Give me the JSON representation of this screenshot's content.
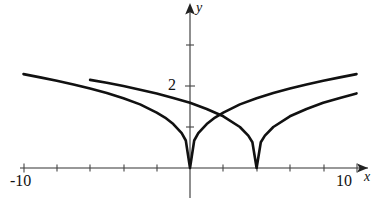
{
  "figure": {
    "background_color": "#ffffff",
    "curve_color": "#111111",
    "axis_color": "#333333"
  },
  "labels": {
    "y_axis_name": "y",
    "x_axis_name": "x",
    "x_min_tick": "-10",
    "x_max_tick": "10",
    "y_tick_two": "2"
  },
  "chart_data": {
    "type": "line",
    "title": "",
    "xlabel": "x",
    "ylabel": "y",
    "xlim": [
      -10,
      10
    ],
    "ylim": [
      0,
      3.2
    ],
    "grid": false,
    "legend": null,
    "x_ticks": [
      -10,
      -8,
      -6,
      -4,
      -2,
      0,
      2,
      4,
      6,
      8,
      10
    ],
    "x_tick_labels": [
      "-10",
      "",
      "",
      "",
      "",
      "",
      "",
      "",
      "",
      "",
      "10"
    ],
    "y_ticks": [
      1,
      2,
      3
    ],
    "y_tick_labels": [
      "",
      "2",
      ""
    ],
    "axis_arrows": [
      "x-positive",
      "y-positive"
    ],
    "annotations": [
      {
        "text": "cusp at origin",
        "x": 0,
        "y": 0
      },
      {
        "text": "cusp at x = 4",
        "x": 4,
        "y": 0
      },
      {
        "text": "curves intersect",
        "x": 2,
        "y": 0.8
      }
    ],
    "series": [
      {
        "name": "y = |x|^(1/3)",
        "cusp_x": 0,
        "cusp_y": 0,
        "x": [
          -10.0,
          -9.0,
          -8.0,
          -7.0,
          -6.0,
          -5.0,
          -4.0,
          -3.0,
          -2.0,
          -1.5,
          -1.0,
          -0.5,
          -0.25,
          0.0,
          0.25,
          0.5,
          1.0,
          1.5,
          2.0,
          3.0,
          4.0,
          5.0,
          6.0,
          7.0,
          8.0,
          9.0,
          10.0
        ],
        "y": [
          2.29,
          2.21,
          2.13,
          2.04,
          1.94,
          1.83,
          1.7,
          1.55,
          1.35,
          1.23,
          1.07,
          0.85,
          0.67,
          0.0,
          0.67,
          0.85,
          1.07,
          1.23,
          1.35,
          1.55,
          1.7,
          1.83,
          1.94,
          2.04,
          2.13,
          2.21,
          2.29
        ]
      },
      {
        "name": "y = |x - 4|^(1/3)",
        "cusp_x": 4,
        "cusp_y": 0,
        "x": [
          -6.0,
          -5.0,
          -4.0,
          -3.0,
          -2.0,
          -1.0,
          0.0,
          1.0,
          2.0,
          3.0,
          3.5,
          3.75,
          4.0,
          4.25,
          4.5,
          5.0,
          6.0,
          7.0,
          8.0,
          9.0,
          10.0,
          11.0
        ],
        "y": [
          2.15,
          2.08,
          2.0,
          1.91,
          1.82,
          1.71,
          1.59,
          1.44,
          1.26,
          1.0,
          0.79,
          0.63,
          0.0,
          0.63,
          0.79,
          1.0,
          1.26,
          1.44,
          1.59,
          1.71,
          1.82,
          1.91
        ]
      }
    ]
  }
}
